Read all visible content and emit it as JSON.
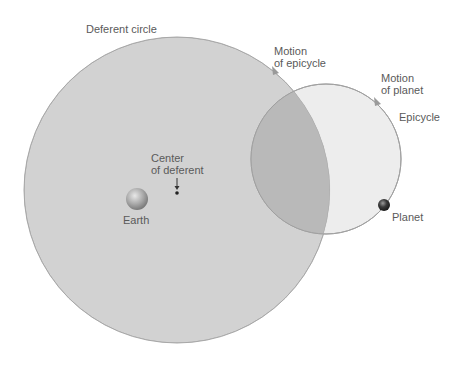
{
  "diagram": {
    "labels": {
      "deferent_circle": "Deferent circle",
      "motion_of_epicycle": [
        "Motion",
        "of epicycle"
      ],
      "motion_of_planet": [
        "Motion",
        "of planet"
      ],
      "epicycle": "Epicycle",
      "center_of_deferent": [
        "Center",
        "of deferent"
      ],
      "earth": "Earth",
      "planet": "Planet"
    },
    "colors": {
      "background": "#ffffff",
      "deferent_fill": "#d2d2d2",
      "epicycle_fill": "#ececec",
      "overlap_fill": "#b9b9b9",
      "outline": "#a0a0a0",
      "text": "#5a5a5a",
      "planet": "#2e2e2e"
    },
    "shapes": {
      "deferent": {
        "cx": 177,
        "cy": 190,
        "r": 153
      },
      "epicycle": {
        "cx": 326,
        "cy": 159,
        "r": 75
      },
      "earth": {
        "cx": 137,
        "cy": 199,
        "r": 11
      },
      "planet": {
        "cx": 384,
        "cy": 205,
        "r": 6
      },
      "center_point": {
        "cx": 177,
        "cy": 193
      }
    }
  }
}
